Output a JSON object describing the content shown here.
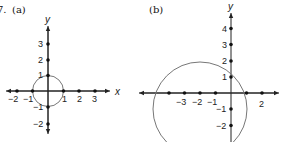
{
  "problem": {
    "number": "7.",
    "panels": [
      {
        "label": "(a)",
        "x_axis_label": "x",
        "y_axis_label": "y",
        "x_ticks": [
          "−2",
          "−1",
          "1",
          "2",
          "3"
        ],
        "y_ticks": [
          "3",
          "2",
          "1",
          "−1",
          "−2"
        ],
        "circle": {
          "center": [
            0,
            0
          ],
          "radius": 1
        }
      },
      {
        "label": "(b)",
        "x_axis_label": "",
        "y_axis_label": "y",
        "x_ticks": [
          "−3",
          "−2",
          "−1",
          "2"
        ],
        "y_ticks": [
          "4",
          "3",
          "2",
          "1",
          "−1",
          "−2"
        ],
        "circle": {
          "center": [
            -2,
            -1
          ],
          "radius": 3
        }
      }
    ]
  },
  "colors": {
    "axis": "#222222",
    "circle": "#777777",
    "dot": "#111111"
  }
}
